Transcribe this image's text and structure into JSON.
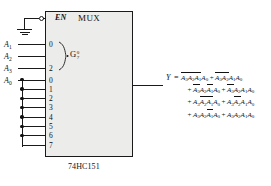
{
  "diagram": {
    "chip": {
      "name": "74HC151",
      "block_title": "MUX",
      "enable_label": "EN",
      "enable_tied_to": "GND"
    },
    "select_group": {
      "label": "G",
      "range_top": "0",
      "range_bottom": "7",
      "pin_top": "0",
      "pin_bottom": "2"
    },
    "select_inputs": [
      {
        "label": "A",
        "sub": "1",
        "pin": "0"
      },
      {
        "label": "A",
        "sub": "2",
        "pin": "1"
      },
      {
        "label": "A",
        "sub": "3",
        "pin": "2"
      }
    ],
    "data_input_label": {
      "label": "A",
      "sub": "0"
    },
    "data_pins": [
      "0",
      "1",
      "2",
      "3",
      "4",
      "5",
      "6",
      "7"
    ],
    "output": {
      "name": "Y",
      "equals": "=",
      "lines": [
        [
          {
            "plus": "",
            "factors": [
              {
                "v": "A",
                "sub": "3",
                "bar": true
              },
              {
                "v": "A",
                "sub": "2",
                "bar": true
              },
              {
                "v": "A",
                "sub": "1",
                "bar": true
              },
              {
                "v": "A",
                "sub": "0",
                "bar": false
              }
            ]
          },
          {
            "plus": "+",
            "factors": [
              {
                "v": "A",
                "sub": "3",
                "bar": true
              },
              {
                "v": "A",
                "sub": "2",
                "bar": true
              },
              {
                "v": "A",
                "sub": "1",
                "bar": false
              },
              {
                "v": "A",
                "sub": "0",
                "bar": false
              }
            ]
          }
        ],
        [
          {
            "plus": "+",
            "factors": [
              {
                "v": "A",
                "sub": "3",
                "bar": true
              },
              {
                "v": "A",
                "sub": "2",
                "bar": false
              },
              {
                "v": "A",
                "sub": "1",
                "bar": true
              },
              {
                "v": "A",
                "sub": "0",
                "bar": false
              }
            ]
          },
          {
            "plus": "+",
            "factors": [
              {
                "v": "A",
                "sub": "3",
                "bar": true
              },
              {
                "v": "A",
                "sub": "2",
                "bar": false
              },
              {
                "v": "A",
                "sub": "1",
                "bar": false
              },
              {
                "v": "A",
                "sub": "0",
                "bar": false
              }
            ]
          }
        ],
        [
          {
            "plus": "+",
            "factors": [
              {
                "v": "A",
                "sub": "3",
                "bar": false
              },
              {
                "v": "A",
                "sub": "2",
                "bar": true
              },
              {
                "v": "A",
                "sub": "1",
                "bar": true
              },
              {
                "v": "A",
                "sub": "0",
                "bar": false
              }
            ]
          },
          {
            "plus": "+",
            "factors": [
              {
                "v": "A",
                "sub": "3",
                "bar": false
              },
              {
                "v": "A",
                "sub": "2",
                "bar": true
              },
              {
                "v": "A",
                "sub": "1",
                "bar": false
              },
              {
                "v": "A",
                "sub": "0",
                "bar": false
              }
            ]
          }
        ],
        [
          {
            "plus": "+",
            "factors": [
              {
                "v": "A",
                "sub": "3",
                "bar": false
              },
              {
                "v": "A",
                "sub": "2",
                "bar": false
              },
              {
                "v": "A",
                "sub": "1",
                "bar": true
              },
              {
                "v": "A",
                "sub": "0",
                "bar": false
              }
            ]
          },
          {
            "plus": "+",
            "factors": [
              {
                "v": "A",
                "sub": "3",
                "bar": false
              },
              {
                "v": "A",
                "sub": "2",
                "bar": false
              },
              {
                "v": "A",
                "sub": "1",
                "bar": false
              },
              {
                "v": "A",
                "sub": "0",
                "bar": false
              }
            ]
          }
        ]
      ]
    },
    "colors": {
      "ink": "#111111",
      "chip_fill": "#ececeb",
      "chip_border": "#1a1a1a",
      "background": "#ffffff"
    }
  }
}
